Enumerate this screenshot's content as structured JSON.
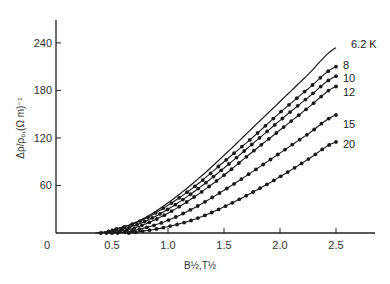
{
  "chart_data": {
    "type": "line",
    "title": "",
    "xlabel": "B½,T½",
    "ylabel": "Δρ/ρ₀,(Ω m)⁻¹",
    "xlim": [
      0,
      2.8
    ],
    "ylim": [
      0,
      270
    ],
    "x_ticks": [
      0,
      0.5,
      1.0,
      1.5,
      2.0,
      2.5
    ],
    "x_tick_labels": [
      "0",
      "0.5",
      "1.0",
      "1.5",
      "2.0",
      "2.5"
    ],
    "y_ticks": [
      60,
      120,
      180,
      240
    ],
    "y_tick_labels": [
      "60",
      "120",
      "180",
      "240"
    ],
    "grid": false,
    "legend": "inline labels at right end of each curve",
    "series": [
      {
        "name": "6.2 K",
        "style": "line",
        "x": [
          0.35,
          0.5,
          0.75,
          1.0,
          1.25,
          1.5,
          1.75,
          2.0,
          2.25,
          2.5
        ],
        "values": [
          0,
          4,
          16,
          38,
          66,
          98,
          132,
          166,
          200,
          234
        ]
      },
      {
        "name": "8",
        "style": "dots",
        "x": [
          0.4,
          0.5,
          0.75,
          1.0,
          1.25,
          1.5,
          1.75,
          2.0,
          2.25,
          2.5
        ],
        "values": [
          0,
          4,
          15,
          35,
          60,
          90,
          120,
          152,
          182,
          210
        ]
      },
      {
        "name": "10",
        "style": "dots",
        "x": [
          0.45,
          0.5,
          0.75,
          1.0,
          1.25,
          1.5,
          1.75,
          2.0,
          2.25,
          2.5
        ],
        "values": [
          0,
          2,
          12,
          30,
          54,
          82,
          112,
          142,
          171,
          198
        ]
      },
      {
        "name": "12",
        "style": "dots",
        "x": [
          0.5,
          0.6,
          0.75,
          1.0,
          1.25,
          1.5,
          1.75,
          2.0,
          2.25,
          2.5
        ],
        "values": [
          0,
          3,
          9,
          25,
          47,
          73,
          102,
          130,
          158,
          185
        ]
      },
      {
        "name": "15",
        "style": "dots",
        "x": [
          0.55,
          0.75,
          1.0,
          1.25,
          1.5,
          1.75,
          2.0,
          2.25,
          2.5
        ],
        "values": [
          0,
          5,
          16,
          33,
          54,
          77,
          101,
          125,
          149
        ]
      },
      {
        "name": "20",
        "style": "dots",
        "x": [
          0.65,
          0.75,
          1.0,
          1.25,
          1.5,
          1.75,
          2.0,
          2.25,
          2.5
        ],
        "values": [
          0,
          2,
          8,
          18,
          33,
          51,
          71,
          93,
          115
        ]
      }
    ]
  },
  "labels": {
    "series": [
      "6.2 K",
      "8",
      "10",
      "12",
      "15",
      "20"
    ]
  }
}
